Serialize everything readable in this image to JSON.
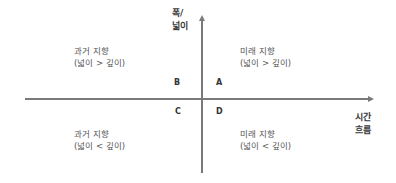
{
  "axes": {
    "y_label_line1": "폭/",
    "y_label_line2": "넓이",
    "x_label_line1": "시간",
    "x_label_line2": "흐름"
  },
  "quadrants": {
    "A": {
      "letter": "A",
      "line1": "미래 지향",
      "line2": "(넓이 > 깊이)"
    },
    "B": {
      "letter": "B",
      "line1": "과거 지향",
      "line2": "(넓이 > 깊이)"
    },
    "C": {
      "letter": "C",
      "line1": "과거 지향",
      "line2": "(넓이 < 깊이)"
    },
    "D": {
      "letter": "D",
      "line1": "미래 지향",
      "line2": "(넓이 < 깊이)"
    }
  },
  "colors": {
    "axis": "#7a7a7a",
    "text": "#555555",
    "background": "#ffffff"
  }
}
